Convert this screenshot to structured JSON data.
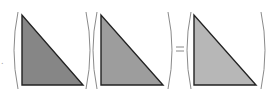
{
  "diagram": {
    "operator": "=",
    "stray_mark": ".",
    "terms": [
      {
        "name": "triangle-1",
        "fill": "#868686",
        "stroke": "#222222",
        "points": "22,15 22,85 83,85"
      },
      {
        "name": "triangle-2",
        "fill": "#9d9d9d",
        "stroke": "#222222",
        "points": "101,15 101,85 163,85"
      },
      {
        "name": "triangle-3",
        "fill": "#b7b7b7",
        "stroke": "#222222",
        "points": "194,15 194,85 256,85"
      }
    ],
    "paren_color": "#8a8a8a"
  }
}
